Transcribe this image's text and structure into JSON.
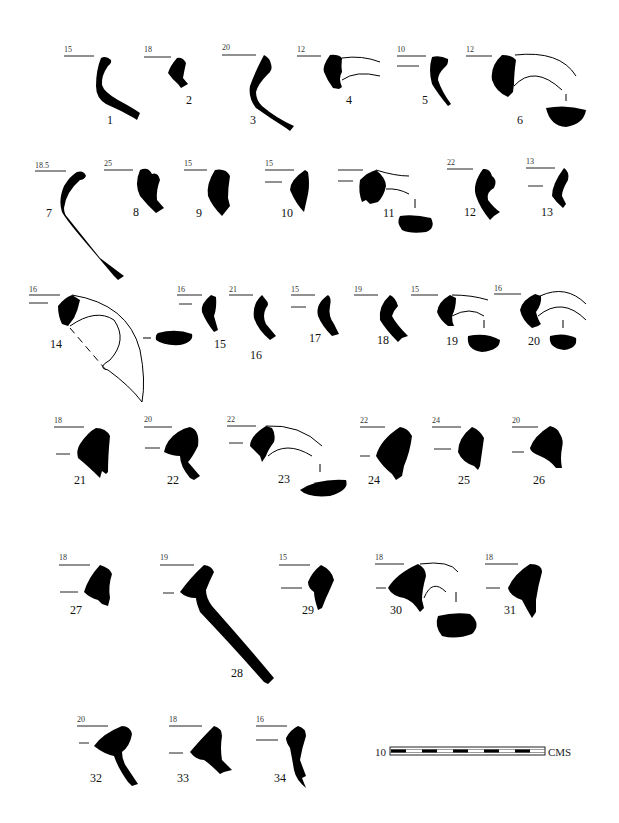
{
  "plate": {
    "type": "pottery rim profile drawings",
    "figure_count": 34
  },
  "profiles": [
    {
      "id": "1",
      "diameter": "15"
    },
    {
      "id": "2",
      "diameter": "18"
    },
    {
      "id": "3",
      "diameter": "20"
    },
    {
      "id": "4",
      "diameter": "12"
    },
    {
      "id": "5",
      "diameter": "10"
    },
    {
      "id": "6",
      "diameter": "12"
    },
    {
      "id": "7",
      "diameter": "18.5"
    },
    {
      "id": "8",
      "diameter": "25"
    },
    {
      "id": "9",
      "diameter": "15"
    },
    {
      "id": "10",
      "diameter": "15"
    },
    {
      "id": "11",
      "diameter": ""
    },
    {
      "id": "12",
      "diameter": "22"
    },
    {
      "id": "13",
      "diameter": "13"
    },
    {
      "id": "14",
      "diameter": "16"
    },
    {
      "id": "15",
      "diameter": "16"
    },
    {
      "id": "16",
      "diameter": "21"
    },
    {
      "id": "17",
      "diameter": "15"
    },
    {
      "id": "18",
      "diameter": "19"
    },
    {
      "id": "19",
      "diameter": "15"
    },
    {
      "id": "20",
      "diameter": "16"
    },
    {
      "id": "21",
      "diameter": "18"
    },
    {
      "id": "22",
      "diameter": "20"
    },
    {
      "id": "23",
      "diameter": "22"
    },
    {
      "id": "24",
      "diameter": "22"
    },
    {
      "id": "25",
      "diameter": "24"
    },
    {
      "id": "26",
      "diameter": "20"
    },
    {
      "id": "27",
      "diameter": "18"
    },
    {
      "id": "28",
      "diameter": "19"
    },
    {
      "id": "29",
      "diameter": "15"
    },
    {
      "id": "30",
      "diameter": "18"
    },
    {
      "id": "31",
      "diameter": "18"
    },
    {
      "id": "32",
      "diameter": "20"
    },
    {
      "id": "33",
      "diameter": "18"
    },
    {
      "id": "34",
      "diameter": "16"
    }
  ],
  "scale_bar": {
    "value": "10",
    "unit": "CMS",
    "segments": 10
  },
  "colors": {
    "ink": "#000000",
    "background": "#ffffff"
  }
}
